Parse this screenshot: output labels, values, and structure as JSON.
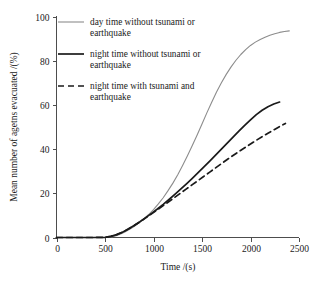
{
  "chart_data": {
    "type": "line",
    "title": "",
    "xlabel": "Time /(s)",
    "ylabel": "Mean number of agetns evacuated /(%)",
    "xlim": [
      0,
      2500
    ],
    "ylim": [
      0,
      100
    ],
    "xticks": [
      "0",
      "500",
      "1000",
      "1500",
      "2000",
      "2500"
    ],
    "xtick_values": [
      0,
      500,
      1000,
      1500,
      2000,
      2500
    ],
    "yticks": [
      "0",
      "20",
      "40",
      "60",
      "80",
      "100"
    ],
    "ytick_values": [
      0,
      20,
      40,
      60,
      80,
      100
    ],
    "grid": false,
    "legend_position": "top-left-inside",
    "series": [
      {
        "name": "day time without tsunami or earthquake",
        "label_line1": "day time without tsunami or",
        "label_line2": "earthquake",
        "style": "solid",
        "color": "#8c8c8c",
        "width": 1.1,
        "x": [
          0,
          100,
          200,
          300,
          400,
          500,
          560,
          600,
          650,
          700,
          750,
          800,
          850,
          900,
          950,
          1000,
          1050,
          1100,
          1150,
          1200,
          1250,
          1300,
          1350,
          1400,
          1450,
          1500,
          1550,
          1600,
          1650,
          1700,
          1750,
          1800,
          1850,
          1900,
          1950,
          2000,
          2050,
          2100,
          2150,
          2200,
          2250,
          2300,
          2350,
          2400
        ],
        "y": [
          0,
          0,
          0,
          0,
          0,
          0,
          0.2,
          0.6,
          1.4,
          2.4,
          3.6,
          5.0,
          6.6,
          8.4,
          10.4,
          12.6,
          15.2,
          18.0,
          21.2,
          24.6,
          28.4,
          32.6,
          37.0,
          41.6,
          46.4,
          51.4,
          56.4,
          61.2,
          65.8,
          70.0,
          73.8,
          77.2,
          80.2,
          82.8,
          85.0,
          86.9,
          88.4,
          89.6,
          90.6,
          91.5,
          92.2,
          92.8,
          93.2,
          93.5
        ]
      },
      {
        "name": "night  time without tsunami or earthquake",
        "label_line1": "night  time without tsunami or",
        "label_line2": "earthquake",
        "style": "solid",
        "color": "#1a1a1a",
        "width": 1.7,
        "x": [
          0,
          100,
          200,
          300,
          400,
          500,
          560,
          620,
          680,
          740,
          800,
          860,
          920,
          980,
          1040,
          1100,
          1160,
          1220,
          1280,
          1340,
          1400,
          1460,
          1520,
          1580,
          1640,
          1700,
          1760,
          1820,
          1880,
          1940,
          2000,
          2060,
          2120,
          2180,
          2240,
          2300
        ],
        "y": [
          0,
          0,
          0,
          0,
          0,
          0.1,
          0.5,
          1.3,
          2.4,
          3.8,
          5.4,
          7.1,
          9.0,
          10.9,
          12.9,
          15.0,
          17.2,
          19.5,
          21.9,
          24.3,
          26.8,
          29.4,
          32.0,
          34.6,
          37.3,
          40.0,
          42.7,
          45.4,
          48.1,
          50.7,
          53.2,
          55.6,
          57.6,
          59.2,
          60.4,
          61.3
        ]
      },
      {
        "name": "night time with tsunami and earthquake",
        "label_line1": "night time with tsunami and",
        "label_line2": "earthquake",
        "style": "dashed",
        "color": "#1a1a1a",
        "width": 1.7,
        "x": [
          0,
          100,
          200,
          300,
          400,
          500,
          560,
          620,
          680,
          740,
          800,
          860,
          920,
          980,
          1040,
          1100,
          1160,
          1220,
          1280,
          1340,
          1400,
          1460,
          1520,
          1580,
          1640,
          1700,
          1760,
          1820,
          1880,
          1940,
          2000,
          2060,
          2120,
          2180,
          2240,
          2300,
          2360
        ],
        "y": [
          0,
          0,
          0,
          0,
          0,
          0.1,
          0.5,
          1.3,
          2.4,
          3.8,
          5.4,
          7.1,
          8.9,
          10.7,
          12.5,
          14.4,
          16.3,
          18.2,
          20.1,
          22.0,
          23.9,
          25.8,
          27.7,
          29.6,
          31.5,
          33.4,
          35.3,
          37.1,
          38.9,
          40.6,
          42.3,
          44.0,
          45.6,
          47.2,
          48.7,
          50.2,
          51.6
        ]
      }
    ]
  },
  "axes": {
    "x_title": "Time /(s)",
    "y_title": "Mean number of agetns evacuated /(%)"
  },
  "legend": {
    "entries": [
      {
        "line1": "day time without tsunami or",
        "line2": "earthquake"
      },
      {
        "line1": "night  time without tsunami or",
        "line2": "earthquake"
      },
      {
        "line1": "night time with tsunami and",
        "line2": "earthquake"
      }
    ]
  },
  "colors": {
    "day_series": "#8c8c8c",
    "night_series": "#1a1a1a",
    "axis": "#4d4d4d",
    "background": "#ffffff"
  }
}
